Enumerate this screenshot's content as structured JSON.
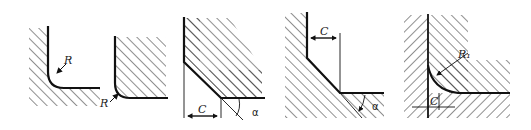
{
  "figure": {
    "colors": {
      "line": "#111111",
      "hatch": "#222222",
      "background": "#ffffff"
    },
    "panels": [
      {
        "id": "fillet-external",
        "label": "R"
      },
      {
        "id": "fillet-internal",
        "label": "R"
      },
      {
        "id": "chamfer-external",
        "labels": {
          "length": "C",
          "angle": "α"
        }
      },
      {
        "id": "chamfer-internal",
        "labels": {
          "length": "C",
          "angle": "α"
        }
      },
      {
        "id": "fillet-mating",
        "labels": {
          "radius": "R₁",
          "length": "C"
        }
      }
    ]
  }
}
